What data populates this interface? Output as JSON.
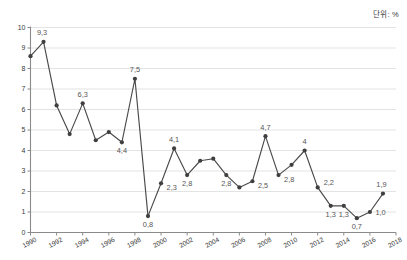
{
  "unit_note": "단위: %",
  "chart_data": {
    "type": "line",
    "title": "",
    "xlabel": "",
    "ylabel": "",
    "unit": "%",
    "decimal_separator": ",",
    "grid": true,
    "legend": "none",
    "xlim": [
      1990,
      2018
    ],
    "ylim": [
      0,
      10
    ],
    "y_ticks": [
      0,
      1,
      2,
      3,
      4,
      5,
      6,
      7,
      8,
      9,
      10
    ],
    "y_tick_labels": [
      "0",
      "1",
      "2",
      "3",
      "4",
      "5",
      "6",
      "7",
      "8",
      "9",
      "10"
    ],
    "x_ticks": [
      1990,
      1992,
      1994,
      1996,
      1998,
      2000,
      2002,
      2004,
      2006,
      2008,
      2010,
      2012,
      2014,
      2016,
      2018
    ],
    "x_tick_labels": [
      "1990",
      "1992",
      "1994",
      "1996",
      "1998",
      "2000",
      "2002",
      "2004",
      "2006",
      "2008",
      "2010",
      "2012",
      "2014",
      "2016",
      "2018"
    ],
    "x": [
      1990,
      1991,
      1992,
      1993,
      1994,
      1995,
      1996,
      1997,
      1998,
      1999,
      2000,
      2001,
      2002,
      2003,
      2004,
      2005,
      2006,
      2007,
      2008,
      2009,
      2010,
      2011,
      2012,
      2013,
      2014,
      2015,
      2016,
      2017
    ],
    "values": [
      8.6,
      9.3,
      6.2,
      4.8,
      6.3,
      4.5,
      4.9,
      4.4,
      7.5,
      0.8,
      2.4,
      4.1,
      2.8,
      3.5,
      3.6,
      2.8,
      2.2,
      2.5,
      4.7,
      2.8,
      3.3,
      4.0,
      2.2,
      1.3,
      1.3,
      0.7,
      1.0,
      1.9
    ],
    "point_labels": [
      {
        "x": 1991,
        "value": 9.3,
        "text": "9,3",
        "pos": "above-left"
      },
      {
        "x": 1994,
        "value": 6.3,
        "text": "6,3",
        "pos": "above"
      },
      {
        "x": 1997,
        "value": 4.4,
        "text": "4,4",
        "pos": "below"
      },
      {
        "x": 1998,
        "value": 7.5,
        "text": "7,5",
        "pos": "above"
      },
      {
        "x": 1999,
        "value": 0.8,
        "text": "0,8",
        "pos": "below"
      },
      {
        "x": 2000,
        "value": 2.4,
        "text": "2,3",
        "pos": "below-right"
      },
      {
        "x": 2001,
        "value": 4.1,
        "text": "4,1",
        "pos": "above"
      },
      {
        "x": 2002,
        "value": 2.8,
        "text": "2,8",
        "pos": "below"
      },
      {
        "x": 2005,
        "value": 2.8,
        "text": "2,8",
        "pos": "below"
      },
      {
        "x": 2007,
        "value": 2.5,
        "text": "2,5",
        "pos": "below-right"
      },
      {
        "x": 2008,
        "value": 4.7,
        "text": "4,7",
        "pos": "above"
      },
      {
        "x": 2009,
        "value": 2.8,
        "text": "2,8",
        "pos": "below-right"
      },
      {
        "x": 2011,
        "value": 4.0,
        "text": "4",
        "pos": "above"
      },
      {
        "x": 2012,
        "value": 2.2,
        "text": "2,2",
        "pos": "above-right"
      },
      {
        "x": 2013,
        "value": 1.3,
        "text": "1,3",
        "pos": "below"
      },
      {
        "x": 2014,
        "value": 1.3,
        "text": "1,3",
        "pos": "below"
      },
      {
        "x": 2015,
        "value": 0.7,
        "text": "0,7",
        "pos": "below"
      },
      {
        "x": 2016,
        "value": 1.0,
        "text": "1,0",
        "pos": "right"
      },
      {
        "x": 2017,
        "value": 1.9,
        "text": "1,9",
        "pos": "above-left"
      }
    ],
    "colors": {
      "line": "#4a4a4a",
      "marker": "#3f3f3f",
      "grid": "#dcdcdc",
      "axis": "#8a8a8a",
      "label_text": "#555555",
      "tick_text": "#3a3a3a",
      "background": "#ffffff"
    }
  }
}
